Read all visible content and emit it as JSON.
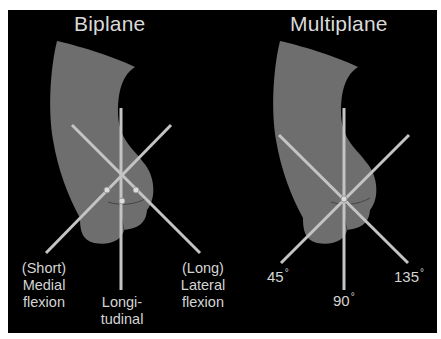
{
  "colors": {
    "background": "#000000",
    "organ_fill": "#6e6e6e",
    "organ_shadow": "#5e5e5e",
    "plane_lines": "#c4c4c4",
    "text": "#d4d4d4",
    "page": "#ffffff"
  },
  "panels": [
    {
      "title": "Biplane",
      "planes": [
        {
          "name": "medial",
          "label_lines": [
            "(Short)",
            "Medial",
            "flexion"
          ]
        },
        {
          "name": "longitudinal",
          "label_lines": [
            "Longi-",
            "tudinal"
          ]
        },
        {
          "name": "lateral",
          "label_lines": [
            "(Long)",
            "Lateral",
            "flexion"
          ]
        }
      ],
      "markers": 3
    },
    {
      "title": "Multiplane",
      "planes": [
        {
          "name": "45",
          "value": "45",
          "unit": "°"
        },
        {
          "name": "90",
          "value": "90",
          "unit": "°"
        },
        {
          "name": "135",
          "value": "135",
          "unit": "°"
        }
      ],
      "markers": 1
    }
  ]
}
